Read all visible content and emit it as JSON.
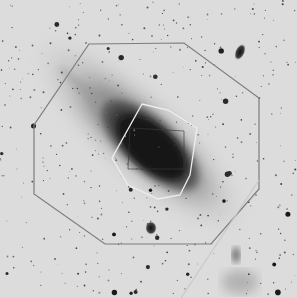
{
  "image": {
    "subject": "spiral galaxy (Andromeda-like) negative photographic plate",
    "tone": "inverted grayscale",
    "colors": {
      "sky": "#dcdcdc",
      "galaxy_core": "#141414",
      "galaxy_disk": "#5a5a5a",
      "outline_dark": "#7a7a7a",
      "outline_light": "#f0f0f0"
    }
  },
  "overlays": [
    {
      "name": "outer-octagon-field",
      "shape": "octagon"
    },
    {
      "name": "inner-octagon-field",
      "shape": "octagon"
    },
    {
      "name": "core-square-field",
      "shape": "square"
    },
    {
      "name": "diagonal-line",
      "shape": "line"
    }
  ],
  "companions": [
    {
      "name": "upper-right-companion-galaxy"
    },
    {
      "name": "lower-companion-galaxy"
    },
    {
      "name": "bottom-right-cluster"
    }
  ]
}
